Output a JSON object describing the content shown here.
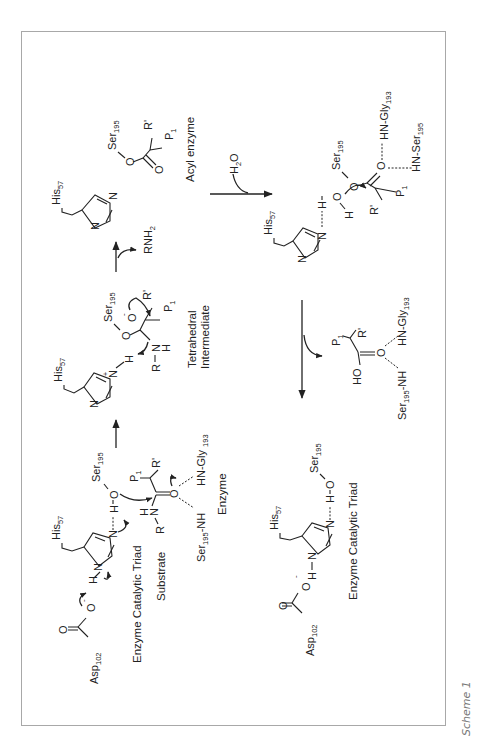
{
  "figure": {
    "caption": "Scheme 1"
  },
  "atoms": {
    "N": "N",
    "O": "O",
    "H": "H",
    "R": "R",
    "Rprime": "R'",
    "P": "P",
    "one": "1",
    "minus": "-",
    "plus": "+",
    "HO": "HO",
    "HN": "H"
  },
  "residues": {
    "his": "His",
    "his_num": "57",
    "ser": "Ser",
    "ser_num": "195",
    "asp": "Asp",
    "asp_num": "102",
    "hn_gly": "HN-Gly",
    "hn_gly_sp": "HN-Gly ",
    "gly_num": "193",
    "hn_ser": "HN-Ser",
    "ser_nh_a": "Ser",
    "ser_nh_b": "-NH"
  },
  "reagents": {
    "h2o_h": "H",
    "h2o_2": "2",
    "h2o_o": "O",
    "rnh2_a": "RNH",
    "rnh2_2": "2"
  },
  "labels": {
    "acyl_enzyme": "Acyl enzyme",
    "tetrahedral": "Tetrahedral",
    "intermediate": "Intermediate",
    "triad_1": "Enzyme Catalytic Triad",
    "substrate": "Substrate",
    "enzyme": "Enzyme",
    "triad_2": "Enzyme Catalytic Triad"
  },
  "steps": [
    {
      "from": "enzyme-substrate complex",
      "to": "tetrahedral intermediate"
    },
    {
      "from": "tetrahedral intermediate",
      "to": "acyl enzyme",
      "byproduct": "RNH2"
    },
    {
      "from": "acyl enzyme",
      "to": "hydrolysis intermediate",
      "reagent": "H2O"
    },
    {
      "from": "hydrolysis intermediate",
      "to": "free acid + regenerated triad"
    }
  ]
}
